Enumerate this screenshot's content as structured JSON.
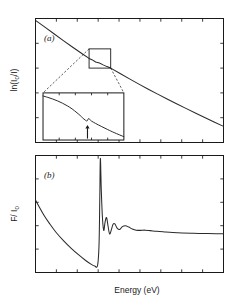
{
  "figure": {
    "background_color": "#ffffff",
    "line_color": "#2b2b2b",
    "axis_color": "#1a1a1a",
    "xlabel": "Energy (eV)",
    "panel_a_label": "(a)",
    "panel_b_label": "(b)",
    "panel_a_ylabel_main": "ln(I",
    "panel_a_ylabel_sub": "0",
    "panel_a_ylabel_tail": "/I)",
    "panel_b_ylabel_main": "F/ I",
    "panel_b_ylabel_sub": "0",
    "inset_arrow_name": "feature-arrow"
  },
  "chart_data": [
    {
      "type": "line",
      "panel": "a",
      "title": "(a)",
      "xlabel": "Energy (eV)",
      "ylabel": "ln(I0/I)",
      "xlim": [
        0,
        1
      ],
      "ylim": [
        0,
        1
      ],
      "grid": false,
      "legend": "none",
      "xticks_count": 9,
      "yticks_count": 5,
      "tick_direction": "in",
      "tick_labels": [],
      "annotations": [
        {
          "kind": "inset-box",
          "x0": 0.285,
          "x1": 0.4,
          "y0": 0.6,
          "y1": 0.755,
          "note": "magnified region on absorption trace"
        },
        {
          "kind": "inset-panel",
          "x0": 0.04,
          "x1": 0.47,
          "y0": 0.02,
          "y1": 0.4,
          "note": "blow-up of boxed region showing weak edge step"
        },
        {
          "kind": "arrow",
          "x": 0.215,
          "y": 0.13,
          "note": "marks the weak absorption feature"
        },
        {
          "kind": "leader-line",
          "note": "dashed lines from box corners to inset corners"
        }
      ],
      "x": [
        0.0,
        0.05,
        0.1,
        0.15,
        0.2,
        0.25,
        0.285,
        0.3,
        0.32,
        0.34,
        0.36,
        0.38,
        0.4,
        0.45,
        0.5,
        0.55,
        0.6,
        0.65,
        0.7,
        0.75,
        0.8,
        0.85,
        0.9,
        0.95,
        1.0
      ],
      "y": [
        0.985,
        0.93,
        0.875,
        0.82,
        0.766,
        0.714,
        0.678,
        0.668,
        0.649,
        0.641,
        0.626,
        0.612,
        0.6,
        0.556,
        0.513,
        0.471,
        0.43,
        0.39,
        0.351,
        0.313,
        0.275,
        0.238,
        0.201,
        0.165,
        0.13
      ]
    },
    {
      "type": "line",
      "panel": "a-inset",
      "title": "inset: magnified absorption step",
      "xlabel": "",
      "ylabel": "",
      "xlim": [
        0,
        1
      ],
      "ylim": [
        0,
        1
      ],
      "grid": false,
      "legend": "none",
      "xticks_count": 5,
      "yticks_count": 0,
      "tick_direction": "in",
      "x": [
        0.0,
        0.06,
        0.12,
        0.18,
        0.24,
        0.3,
        0.36,
        0.42,
        0.46,
        0.49,
        0.52,
        0.545,
        0.56,
        0.575,
        0.6,
        0.65,
        0.72,
        0.8,
        0.88,
        1.0
      ],
      "y": [
        0.935,
        0.905,
        0.87,
        0.83,
        0.782,
        0.726,
        0.66,
        0.578,
        0.52,
        0.47,
        0.425,
        0.405,
        0.452,
        0.442,
        0.402,
        0.352,
        0.29,
        0.222,
        0.158,
        0.07
      ]
    },
    {
      "type": "line",
      "panel": "b",
      "title": "(b)",
      "xlabel": "Energy (eV)",
      "ylabel": "F/I0",
      "xlim": [
        0,
        1
      ],
      "ylim": [
        0,
        1
      ],
      "grid": false,
      "legend": "none",
      "xticks_count": 9,
      "yticks_count": 5,
      "tick_direction": "in",
      "tick_labels": [],
      "annotations": [
        {
          "kind": "feature",
          "name": "white-line-peak",
          "x": 0.345,
          "y": 0.975
        },
        {
          "kind": "feature",
          "name": "pre-edge-minimum",
          "x": 0.315,
          "y": 0.055
        },
        {
          "kind": "feature",
          "name": "exafs-oscillations",
          "x_range": [
            0.37,
            0.62
          ]
        }
      ],
      "x": [
        0.0,
        0.02,
        0.045,
        0.075,
        0.11,
        0.15,
        0.19,
        0.23,
        0.265,
        0.295,
        0.315,
        0.33,
        0.338,
        0.342,
        0.345,
        0.35,
        0.356,
        0.363,
        0.37,
        0.378,
        0.386,
        0.394,
        0.403,
        0.412,
        0.422,
        0.434,
        0.448,
        0.462,
        0.478,
        0.496,
        0.515,
        0.536,
        0.558,
        0.582,
        0.61,
        0.645,
        0.685,
        0.73,
        0.78,
        0.84,
        0.9,
        0.96,
        1.0
      ],
      "y": [
        0.62,
        0.56,
        0.49,
        0.418,
        0.342,
        0.27,
        0.206,
        0.15,
        0.105,
        0.072,
        0.055,
        0.06,
        0.24,
        0.64,
        0.975,
        0.7,
        0.47,
        0.36,
        0.43,
        0.47,
        0.395,
        0.33,
        0.362,
        0.41,
        0.415,
        0.38,
        0.368,
        0.392,
        0.4,
        0.388,
        0.372,
        0.362,
        0.36,
        0.362,
        0.358,
        0.352,
        0.347,
        0.342,
        0.338,
        0.335,
        0.333,
        0.332,
        0.331
      ]
    }
  ]
}
